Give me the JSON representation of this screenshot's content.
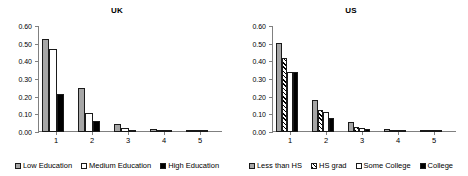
{
  "chart_data": [
    {
      "type": "bar",
      "title": "UK",
      "xlabel": "",
      "ylabel": "",
      "categories": [
        "1",
        "2",
        "3",
        "4",
        "5"
      ],
      "ylim": [
        0.0,
        0.6
      ],
      "yticks": [
        "0.00",
        "0.10",
        "0.20",
        "0.30",
        "0.40",
        "0.50",
        "0.60"
      ],
      "grid": false,
      "legend_position": "bottom",
      "series": [
        {
          "name": "Low Education",
          "fill": "gray",
          "values": [
            0.525,
            0.248,
            0.048,
            0.018,
            0.003
          ]
        },
        {
          "name": "Medium Education",
          "fill": "white",
          "values": [
            0.468,
            0.108,
            0.025,
            0.004,
            0.001
          ]
        },
        {
          "name": "High Education",
          "fill": "black",
          "values": [
            0.215,
            0.065,
            0.013,
            0.002,
            0.0
          ]
        }
      ]
    },
    {
      "type": "bar",
      "title": "US",
      "xlabel": "",
      "ylabel": "",
      "categories": [
        "1",
        "2",
        "3",
        "4",
        "5"
      ],
      "ylim": [
        0.0,
        0.6
      ],
      "yticks": [
        "0.00",
        "0.10",
        "0.20",
        "0.30",
        "0.40",
        "0.50",
        "0.60"
      ],
      "grid": false,
      "legend_position": "bottom",
      "series": [
        {
          "name": "Less than HS",
          "fill": "gray",
          "values": [
            0.503,
            0.182,
            0.055,
            0.015,
            0.002
          ]
        },
        {
          "name": "HS grad",
          "fill": "hatch",
          "values": [
            0.42,
            0.122,
            0.028,
            0.008,
            0.001
          ]
        },
        {
          "name": "Some College",
          "fill": "white",
          "values": [
            0.338,
            0.115,
            0.022,
            0.005,
            0.001
          ]
        },
        {
          "name": "College",
          "fill": "black",
          "values": [
            0.342,
            0.082,
            0.015,
            0.002,
            0.0
          ]
        }
      ]
    }
  ]
}
